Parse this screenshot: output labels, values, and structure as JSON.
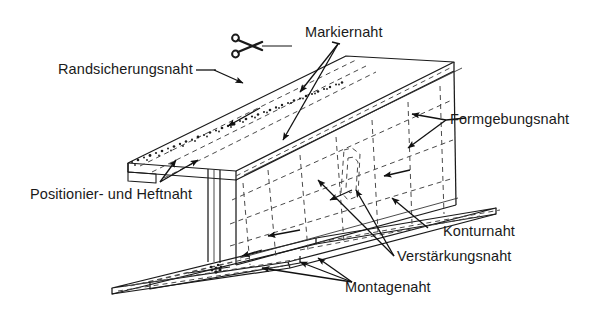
{
  "figure": {
    "background_color": "#ffffff",
    "ink_color": "#1a1a1a",
    "width": 601,
    "height": 309
  },
  "labels": {
    "randsicherungsnaht": "Randsicherungsnaht",
    "markiernaht": "Markiernaht",
    "formgebungsnaht": "Formgebungsnaht",
    "positionier_und_heftnaht": "Positionier- und Heftnaht",
    "konturnaht": "Konturnaht",
    "verstaerkungsnaht": "Verstärkungsnaht",
    "montagenaht": "Montagenaht"
  },
  "icons": {
    "scissors": "scissors-icon"
  },
  "annotations": [
    {
      "id": "randsicherungsnaht",
      "label": "Randsicherungsnaht",
      "arrows": 1,
      "target": "top-flange-edge"
    },
    {
      "id": "markiernaht",
      "label": "Markiernaht",
      "arrows": 2,
      "target": "web-upper"
    },
    {
      "id": "formgebungsnaht",
      "label": "Formgebungsnaht",
      "arrows": 2,
      "target": "right-end-face"
    },
    {
      "id": "positionier_und_heftnaht",
      "label": "Positionier- und Heftnaht",
      "arrows": 2,
      "target": "flange-web-junction"
    },
    {
      "id": "konturnaht",
      "label": "Konturnaht",
      "arrows": 1,
      "target": "base-plate-edge"
    },
    {
      "id": "verstaerkungsnaht",
      "label": "Verstärkungsnaht",
      "arrows": 2,
      "target": "web-lower"
    },
    {
      "id": "montagenaht",
      "label": "Montagenaht",
      "arrows": 2,
      "target": "base-plate"
    }
  ]
}
